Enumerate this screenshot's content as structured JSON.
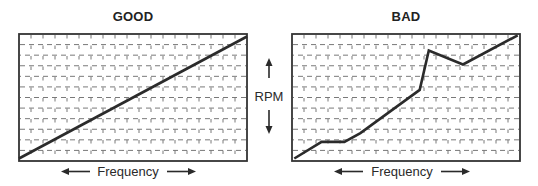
{
  "chart_data": [
    {
      "type": "line",
      "title": "GOOD",
      "xlabel": "Frequency",
      "ylabel": "RPM",
      "xlim": [
        0,
        100
      ],
      "ylim": [
        0,
        100
      ],
      "grid": true,
      "series": [
        {
          "name": "RPM vs Frequency",
          "x": [
            0,
            100
          ],
          "y": [
            2,
            98
          ]
        }
      ]
    },
    {
      "type": "line",
      "title": "BAD",
      "xlabel": "Frequency",
      "ylabel": "RPM",
      "xlim": [
        0,
        100
      ],
      "ylim": [
        0,
        100
      ],
      "grid": true,
      "series": [
        {
          "name": "RPM vs Frequency",
          "x": [
            1,
            13,
            23,
            30,
            56,
            60,
            75,
            99
          ],
          "y": [
            2,
            15,
            15,
            22,
            56,
            87,
            76,
            99
          ]
        }
      ]
    }
  ],
  "labels": {
    "good_title": "GOOD",
    "bad_title": "BAD",
    "rpm": "RPM",
    "frequency": "Frequency"
  },
  "colors": {
    "line": "#2b2b2b",
    "frame": "#333333",
    "grid": "#6a6a6a"
  }
}
